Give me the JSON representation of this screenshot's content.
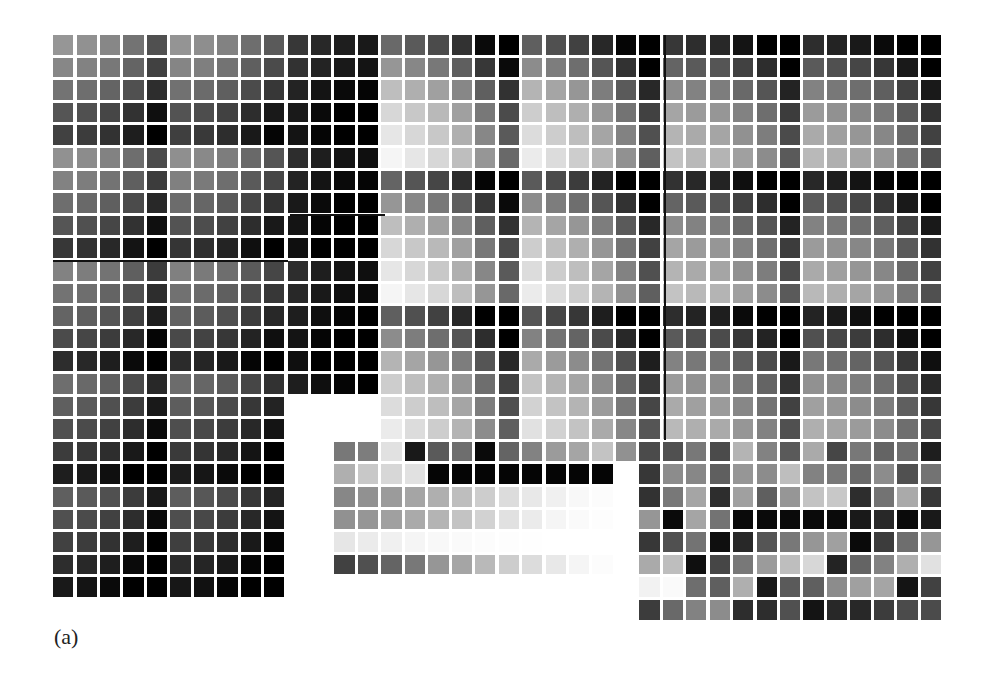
{
  "figure": {
    "caption": "(a)",
    "grid": {
      "origin_x": 53,
      "origin_y": 35,
      "col_pitch": 23.45,
      "row_pitch": 22.6,
      "gap": 3,
      "total_cols": 38,
      "total_rows": 26
    },
    "blocks": [
      {
        "name": "left-block",
        "row0": 0,
        "col0": 0,
        "rows": 25,
        "cols": 10,
        "pattern": "kron",
        "row_levels": [
          150,
          135,
          115,
          85,
          65,
          145,
          130,
          110,
          85,
          55,
          130,
          115,
          100,
          75,
          45,
          110,
          95,
          80,
          60,
          30,
          95,
          80,
          65,
          45,
          25
        ],
        "col_offsets": [
          0,
          -5,
          -15,
          -35,
          -70,
          -2,
          -8,
          -20,
          -40,
          -60
        ]
      },
      {
        "name": "middle-dark-block",
        "row0": 0,
        "col0": 10,
        "rows": 16,
        "cols": 4,
        "pattern": "kron",
        "row_levels": [
          60,
          55,
          40,
          30,
          25,
          50,
          40,
          30,
          25,
          20,
          50,
          45,
          35,
          25,
          20,
          35
        ],
        "col_offsets": [
          -5,
          -20,
          -30,
          -35
        ]
      },
      {
        "name": "right-main-block",
        "row0": 0,
        "col0": 14,
        "rows": 18,
        "cols": 24,
        "pattern": "kron",
        "row_levels": [
          105,
          150,
          190,
          215,
          230,
          245,
          100,
          150,
          190,
          215,
          230,
          245,
          95,
          140,
          180,
          205,
          220,
          235
        ],
        "col_offsets": [
          0,
          -15,
          -30,
          -55,
          -95,
          -140,
          -10,
          -25,
          -40,
          -65,
          -100,
          -150,
          -50,
          -60,
          -65,
          -85,
          -105,
          -155,
          -60,
          -70,
          -80,
          -95,
          -125,
          -165
        ]
      },
      {
        "name": "bottom-middle-block",
        "row0": 18,
        "col0": 12,
        "rows": 6,
        "cols": 13,
        "pattern": "matrix",
        "values": [
          [
            120,
            125,
            225,
            25,
            90,
            110,
            10,
            100,
            130,
            155,
            165,
            195,
            145
          ],
          [
            175,
            200,
            215,
            225,
            5,
            5,
            5,
            5,
            5,
            5,
            5,
            5,
            255
          ],
          [
            135,
            145,
            155,
            165,
            175,
            190,
            205,
            220,
            232,
            240,
            248,
            252,
            255
          ],
          [
            145,
            150,
            160,
            170,
            180,
            195,
            210,
            225,
            235,
            245,
            250,
            253,
            255
          ],
          [
            230,
            235,
            240,
            245,
            248,
            250,
            252,
            253,
            254,
            255,
            255,
            255,
            255
          ],
          [
            65,
            80,
            100,
            120,
            150,
            165,
            185,
            205,
            220,
            232,
            245,
            252,
            255
          ]
        ]
      },
      {
        "name": "bottom-right-block",
        "row0": 18,
        "col0": 25,
        "rows": 8,
        "cols": 13,
        "pattern": "matrix",
        "values": [
          [
            75,
            80,
            120,
            75,
            180,
            130,
            90,
            170,
            70,
            120,
            100,
            110,
            30
          ],
          [
            55,
            140,
            135,
            95,
            150,
            140,
            190,
            130,
            120,
            105,
            140,
            80,
            115
          ],
          [
            50,
            120,
            165,
            45,
            160,
            95,
            150,
            195,
            200,
            45,
            115,
            170,
            55
          ],
          [
            150,
            10,
            165,
            115,
            10,
            10,
            10,
            10,
            10,
            25,
            40,
            10,
            25
          ],
          [
            55,
            80,
            115,
            15,
            40,
            85,
            120,
            150,
            160,
            10,
            60,
            110,
            150
          ],
          [
            170,
            190,
            15,
            70,
            120,
            155,
            190,
            215,
            35,
            100,
            130,
            175,
            225
          ],
          [
            242,
            250,
            110,
            95,
            175,
            25,
            90,
            95,
            140,
            160,
            165,
            20,
            65
          ],
          [
            60,
            105,
            130,
            140,
            45,
            45,
            80,
            20,
            40,
            40,
            60,
            75,
            75
          ]
        ]
      }
    ],
    "rules": [
      {
        "name": "left-horizontal-rule",
        "x": 53,
        "y": 260,
        "w": 235,
        "h": 2
      },
      {
        "name": "middle-horizontal-rule",
        "x": 290,
        "y": 214,
        "w": 95,
        "h": 2
      },
      {
        "name": "right-vertical-rule",
        "x": 664,
        "y": 35,
        "w": 2,
        "h": 405
      }
    ]
  }
}
